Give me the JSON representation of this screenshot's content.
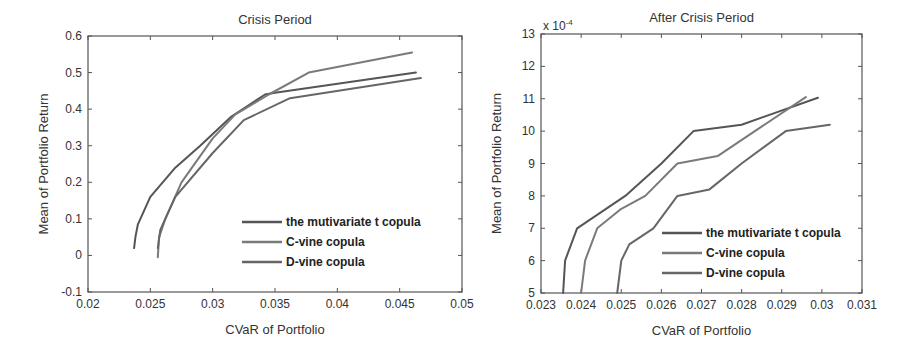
{
  "chart_data": [
    {
      "type": "line",
      "title": "Crisis Period",
      "xlabel": "CVaR of Portfolio",
      "ylabel": "Mean of Portfolio Return",
      "xlim": [
        0.02,
        0.05
      ],
      "ylim": [
        -0.1,
        0.6
      ],
      "xticks": [
        0.02,
        0.025,
        0.03,
        0.035,
        0.04,
        0.045,
        0.05
      ],
      "xtick_labels": [
        "0.02",
        "0.025",
        "0.03",
        "0.035",
        "0.04",
        "0.045",
        "0.05"
      ],
      "yticks": [
        -0.1,
        0,
        0.1,
        0.2,
        0.3,
        0.4,
        0.5,
        0.6
      ],
      "ytick_labels": [
        "-0.1",
        "0",
        "0.1",
        "0.2",
        "0.3",
        "0.4",
        "0.5",
        "0.6"
      ],
      "grid": false,
      "legend_position": "lower right",
      "series": [
        {
          "name": "the mutivariate t copula",
          "color": "#555555",
          "points": [
            [
              0.0237,
              0.02
            ],
            [
              0.0238,
              0.05
            ],
            [
              0.024,
              0.085
            ],
            [
              0.025,
              0.16
            ],
            [
              0.027,
              0.24
            ],
            [
              0.029,
              0.3
            ],
            [
              0.0315,
              0.38
            ],
            [
              0.0342,
              0.44
            ],
            [
              0.035,
              0.445
            ],
            [
              0.0463,
              0.5
            ]
          ]
        },
        {
          "name": "C-vine copula",
          "color": "#7a7a7a",
          "points": [
            [
              0.0256,
              -0.005
            ],
            [
              0.0257,
              0.05
            ],
            [
              0.0262,
              0.1
            ],
            [
              0.0275,
              0.2
            ],
            [
              0.03,
              0.32
            ],
            [
              0.0318,
              0.385
            ],
            [
              0.0345,
              0.44
            ],
            [
              0.0377,
              0.5
            ],
            [
              0.046,
              0.555
            ]
          ]
        },
        {
          "name": "D-vine copula",
          "color": "#666666",
          "points": [
            [
              0.0256,
              0.02
            ],
            [
              0.0258,
              0.07
            ],
            [
              0.027,
              0.16
            ],
            [
              0.03,
              0.28
            ],
            [
              0.0325,
              0.37
            ],
            [
              0.0362,
              0.43
            ],
            [
              0.0467,
              0.485
            ]
          ]
        }
      ]
    },
    {
      "type": "line",
      "title": "After Crisis Period",
      "xlabel": "CVaR of Portfolio",
      "ylabel": "Mean of Portfolio Return",
      "y_multiplier": "x 10^-4",
      "y_multiplier_base": "x 10",
      "y_multiplier_exp": "-4",
      "xlim": [
        0.023,
        0.031
      ],
      "ylim": [
        5,
        13
      ],
      "xticks": [
        0.023,
        0.024,
        0.025,
        0.026,
        0.027,
        0.028,
        0.029,
        0.03,
        0.031
      ],
      "xtick_labels": [
        "0.023",
        "0.024",
        "0.025",
        "0.026",
        "0.027",
        "0.028",
        "0.029",
        "0.03",
        "0.031"
      ],
      "yticks": [
        5,
        6,
        7,
        8,
        9,
        10,
        11,
        12,
        13
      ],
      "ytick_labels": [
        "5",
        "6",
        "7",
        "8",
        "9",
        "10",
        "11",
        "12",
        "13"
      ],
      "grid": false,
      "legend_position": "lower right",
      "series": [
        {
          "name": "the mutivariate t copula",
          "color": "#555555",
          "points": [
            [
              0.02355,
              5
            ],
            [
              0.0236,
              6
            ],
            [
              0.0239,
              7
            ],
            [
              0.0251,
              8
            ],
            [
              0.026,
              9
            ],
            [
              0.0268,
              10
            ],
            [
              0.028,
              10.2
            ],
            [
              0.0299,
              11.03
            ]
          ]
        },
        {
          "name": "C-vine copula",
          "color": "#7a7a7a",
          "points": [
            [
              0.024,
              5
            ],
            [
              0.0241,
              6
            ],
            [
              0.0244,
              7
            ],
            [
              0.025,
              7.6
            ],
            [
              0.0256,
              8
            ],
            [
              0.0264,
              9
            ],
            [
              0.0274,
              9.23
            ],
            [
              0.0296,
              11.05
            ]
          ]
        },
        {
          "name": "D-vine copula",
          "color": "#666666",
          "points": [
            [
              0.0249,
              5
            ],
            [
              0.025,
              6
            ],
            [
              0.0252,
              6.5
            ],
            [
              0.0258,
              7
            ],
            [
              0.0264,
              8
            ],
            [
              0.0272,
              8.2
            ],
            [
              0.028,
              9
            ],
            [
              0.0291,
              10.0
            ],
            [
              0.0302,
              10.2
            ]
          ]
        }
      ]
    }
  ],
  "layout": {
    "panels": [
      {
        "box": [
          88,
          36,
          462,
          292
        ],
        "legend": {
          "x": 242,
          "y": 222
        }
      },
      {
        "box": [
          541,
          34,
          862,
          293
        ],
        "legend": {
          "x": 662,
          "y": 233
        }
      }
    ]
  }
}
